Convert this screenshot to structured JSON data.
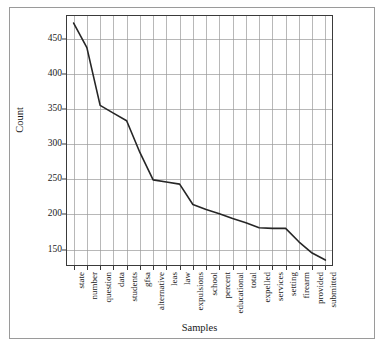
{
  "chart_data": {
    "type": "line",
    "title": "",
    "xlabel": "Samples",
    "ylabel": "Count",
    "categories": [
      "state",
      "number",
      "question",
      "data",
      "students",
      "gfsa",
      "alternative",
      "leas",
      "law",
      "expulsions",
      "school",
      "percent",
      "educational",
      "total",
      "expelled",
      "services",
      "setting",
      "firearm",
      "provided",
      "submitted"
    ],
    "values": [
      472,
      437,
      355,
      344,
      333,
      288,
      249,
      246,
      243,
      214,
      207,
      201,
      194,
      188,
      181,
      180,
      180,
      161,
      145,
      135
    ],
    "series": [
      {
        "name": "Count",
        "values": [
          472,
          437,
          355,
          344,
          333,
          288,
          249,
          246,
          243,
          214,
          207,
          201,
          194,
          188,
          181,
          180,
          180,
          161,
          145,
          135
        ]
      }
    ],
    "yticks": [
      150,
      200,
      250,
      300,
      350,
      400,
      450
    ],
    "ylim": [
      128,
      482
    ],
    "grid": true,
    "grid_vertical": true,
    "grid_horizontal": true,
    "legend": "none",
    "line_color": "#262626",
    "grid_color": "#9a9a9a",
    "axis_color": "#3a3a3a",
    "background": "#ffffff"
  },
  "axes": {
    "x_title": "Samples",
    "y_title": "Count"
  }
}
